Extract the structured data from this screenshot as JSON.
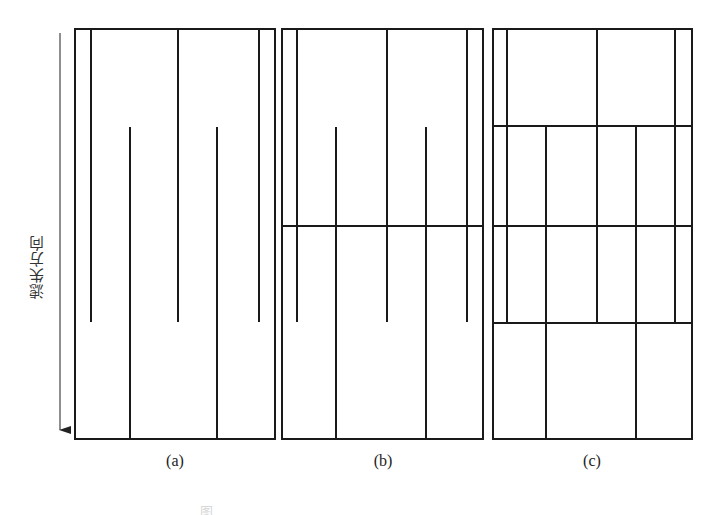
{
  "figure": {
    "axis_label": "滤失方向",
    "stroke_color": "#1a1a1a",
    "panels": [
      {
        "id": "a",
        "label": "(a)",
        "frame": {
          "x1": 75,
          "y1": 29,
          "x2": 275,
          "y2": 439
        },
        "horizontal_lines": [],
        "vertical_lines": [
          {
            "x": 91,
            "y1": 29,
            "y2": 322
          },
          {
            "x": 178,
            "y1": 29,
            "y2": 322
          },
          {
            "x": 259,
            "y1": 29,
            "y2": 322
          },
          {
            "x": 130,
            "y1": 127,
            "y2": 439
          },
          {
            "x": 217,
            "y1": 127,
            "y2": 439
          }
        ]
      },
      {
        "id": "b",
        "label": "(b)",
        "frame": {
          "x1": 282,
          "y1": 29,
          "x2": 483,
          "y2": 439
        },
        "horizontal_lines": [
          {
            "y": 226,
            "x1": 282,
            "x2": 483
          }
        ],
        "vertical_lines": [
          {
            "x": 297,
            "y1": 29,
            "y2": 322
          },
          {
            "x": 387,
            "y1": 29,
            "y2": 322
          },
          {
            "x": 467,
            "y1": 29,
            "y2": 322
          },
          {
            "x": 336,
            "y1": 127,
            "y2": 439
          },
          {
            "x": 426,
            "y1": 127,
            "y2": 439
          }
        ]
      },
      {
        "id": "c",
        "label": "(c)",
        "frame": {
          "x1": 493,
          "y1": 29,
          "x2": 692,
          "y2": 439
        },
        "horizontal_lines": [
          {
            "y": 126,
            "x1": 493,
            "x2": 692
          },
          {
            "y": 226,
            "x1": 493,
            "x2": 692
          },
          {
            "y": 323,
            "x1": 493,
            "x2": 692
          }
        ],
        "vertical_lines": [
          {
            "x": 507,
            "y1": 29,
            "y2": 323
          },
          {
            "x": 597,
            "y1": 29,
            "y2": 323
          },
          {
            "x": 675,
            "y1": 29,
            "y2": 323
          },
          {
            "x": 546,
            "y1": 126,
            "y2": 439
          },
          {
            "x": 636,
            "y1": 126,
            "y2": 439
          }
        ]
      }
    ],
    "arrow": {
      "x": 60,
      "y1": 33,
      "y2": 440
    },
    "caption": "图"
  }
}
